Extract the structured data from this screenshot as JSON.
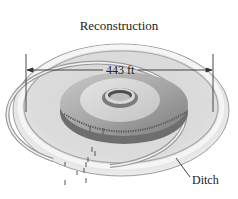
{
  "figure": {
    "title": "Reconstruction",
    "dimension_label": "443 ft",
    "callouts": [
      {
        "label": "Ditch"
      }
    ]
  },
  "colors": {
    "background": "#ffffff",
    "ground_light": "#e6e6e6",
    "ground_mid": "#bdbdbd",
    "ground_dark": "#8a8a8a",
    "platform": "#a6a6a6",
    "ink": "#222222"
  }
}
